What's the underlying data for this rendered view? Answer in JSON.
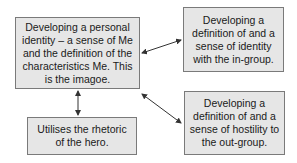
{
  "diagram": {
    "nodes": [
      {
        "id": "main",
        "text": "Developing a personal identity – a sense of Me and the definition of the characteristics Me. This is the imagoe."
      },
      {
        "id": "in_group",
        "text": "Developing a definition of and a sense of identity with the in-group."
      },
      {
        "id": "hero",
        "text": "Utilises the rhetoric of the hero."
      },
      {
        "id": "out_group",
        "text": "Developing a definition of and a sense of hostility to the out-group."
      }
    ],
    "edges": [
      {
        "from": "main",
        "to": "in_group",
        "type": "bidirectional"
      },
      {
        "from": "main",
        "to": "out_group",
        "type": "bidirectional"
      },
      {
        "from": "main",
        "to": "hero",
        "type": "bidirectional"
      }
    ],
    "colors": {
      "box_fill": "#e6e6e6",
      "box_border": "#7a7a7a",
      "arrow": "#333333",
      "text": "#1a1a1a"
    }
  }
}
